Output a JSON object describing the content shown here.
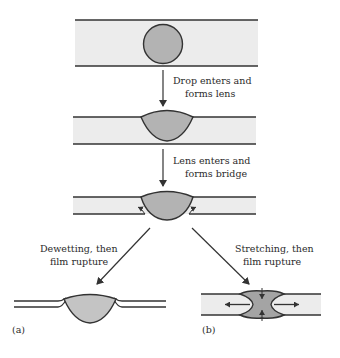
{
  "diagram": {
    "type": "process-flow",
    "colors": {
      "film": "#ececec",
      "drop": "#b3b3b3",
      "drop_dark": "#a0a0a0",
      "line": "#333333"
    },
    "steps": [
      {
        "id": "drop-in-film",
        "description": "Spherical drop inside thick film"
      },
      {
        "id": "lens",
        "description": "Drop forms lens at film surface"
      },
      {
        "id": "bridge",
        "description": "Lens bridges both film surfaces"
      }
    ],
    "transitions": [
      {
        "from": "drop-in-film",
        "to": "lens",
        "label_line1": "Drop enters and",
        "label_line2": "forms lens"
      },
      {
        "from": "lens",
        "to": "bridge",
        "label_line1": "Lens enters and",
        "label_line2": "forms bridge"
      },
      {
        "from": "bridge",
        "to": "a",
        "label_line1": "Dewetting, then",
        "label_line2": "film rupture"
      },
      {
        "from": "bridge",
        "to": "b",
        "label_line1": "Stretching, then",
        "label_line2": "film rupture"
      }
    ],
    "panels": [
      {
        "id": "a",
        "label": "(a)"
      },
      {
        "id": "b",
        "label": "(b)"
      }
    ]
  }
}
